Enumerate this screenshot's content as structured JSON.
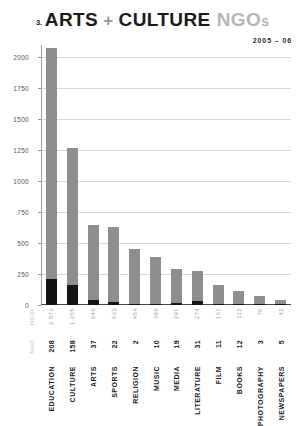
{
  "header": {
    "section_number": "3.",
    "title_main": "ARTS",
    "title_plus": "+",
    "title_second": "CULTURE",
    "title_tail": "NGO",
    "title_tail_small": "s",
    "subtitle": "2005 – 06"
  },
  "legend": {
    "total_header": "NGOs",
    "ngo_header": "NGO"
  },
  "chart_data": {
    "type": "bar",
    "title": "ARTS + CULTURE NGOs",
    "subtitle": "2005 – 06",
    "xlabel": "",
    "ylabel": "",
    "ylim": [
      0,
      2100
    ],
    "grid": true,
    "stacked": true,
    "legend_position": "none",
    "yticks": [
      0,
      250,
      500,
      750,
      1000,
      1250,
      1500,
      1750,
      2000
    ],
    "ytick_labels": [
      "0",
      "250",
      "500",
      "750",
      "1000",
      "1250",
      "1500",
      "1750",
      "2000"
    ],
    "categories": [
      "EDUCATION",
      "CULTURE",
      "ARTS",
      "SPORTS",
      "RELIGION",
      "MUSIC",
      "MEDIA",
      "LITERATURE",
      "FILM",
      "BOOKS",
      "PHOTOGRAPHY",
      "NEWSPAPERS"
    ],
    "series": [
      {
        "name": "NGO",
        "color": "#141414",
        "values": [
          208,
          158,
          37,
          22,
          2,
          10,
          19,
          31,
          11,
          12,
          3,
          5
        ],
        "labels": [
          "208",
          "158",
          "37",
          "22",
          "2",
          "10",
          "19",
          "31",
          "11",
          "12",
          "3",
          "5"
        ]
      },
      {
        "name": "NGOs",
        "color": "#8e8e8e",
        "values": [
          2073,
          1265,
          646,
          633,
          454,
          386,
          291,
          274,
          161,
          112,
          70,
          42
        ],
        "labels": [
          "2 073",
          "1 265",
          "646",
          "633",
          "454",
          "386",
          "291",
          "274",
          "161",
          "112",
          "70",
          "42"
        ]
      }
    ]
  },
  "colors": {
    "bar_dark": "#141414",
    "bar_light": "#8e8e8e",
    "grid": "#d8d8d8",
    "axis": "#4a4a4a",
    "title_dark": "#1a1a1a",
    "title_muted": "#b5b5b5"
  }
}
